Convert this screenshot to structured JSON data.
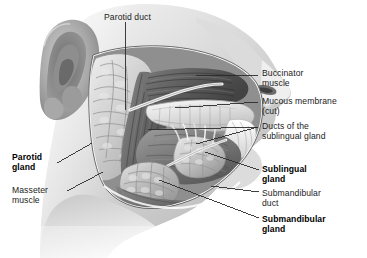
{
  "figure": {
    "background_color": "#ffffff",
    "ink_color": "#1c1c1c",
    "leader_color": "#2b2b2b"
  },
  "labels": [
    {
      "id": "parotid-duct",
      "name": "parotid-duct",
      "lines": [
        "Parotid duct"
      ],
      "bold": false,
      "x": 104,
      "y": 12,
      "align": "left"
    },
    {
      "id": "buccinator-muscle",
      "name": "buccinator-muscle",
      "lines": [
        "Buccinator",
        "muscle"
      ],
      "bold": false,
      "x": 262,
      "y": 68,
      "align": "left"
    },
    {
      "id": "mucous-membrane-cut",
      "name": "mucous-membrane-cut",
      "lines": [
        "Mucous membrane",
        "(cut)"
      ],
      "bold": false,
      "x": 262,
      "y": 96,
      "align": "left"
    },
    {
      "id": "ducts-of-sublingual-gland",
      "name": "ducts-of-the-sublingual-gland",
      "lines": [
        "Ducts of the",
        "sublingual gland"
      ],
      "bold": false,
      "x": 262,
      "y": 121,
      "align": "left"
    },
    {
      "id": "sublingual-gland",
      "name": "sublingual-gland",
      "lines": [
        "Sublingual",
        "gland"
      ],
      "bold": true,
      "x": 262,
      "y": 164,
      "align": "left"
    },
    {
      "id": "submandibular-duct",
      "name": "submandibular-duct",
      "lines": [
        "Submandibular",
        "duct"
      ],
      "bold": false,
      "x": 262,
      "y": 188,
      "align": "left"
    },
    {
      "id": "submandibular-gland",
      "name": "submandibular-gland",
      "lines": [
        "Submandibular",
        "gland"
      ],
      "bold": true,
      "x": 262,
      "y": 214,
      "align": "left"
    },
    {
      "id": "parotid-gland",
      "name": "parotid-gland",
      "lines": [
        "Parotid",
        "gland"
      ],
      "bold": true,
      "x": 12,
      "y": 152,
      "align": "left"
    },
    {
      "id": "masseter-muscle",
      "name": "masseter-muscle",
      "lines": [
        "Masseter",
        "muscle"
      ],
      "bold": false,
      "x": 12,
      "y": 185,
      "align": "left"
    }
  ],
  "leaders": [
    {
      "name": "leader-parotid-duct",
      "points": "125,22 125,110"
    },
    {
      "name": "leader-buccinator-muscle",
      "points": "196,75 258,75"
    },
    {
      "name": "leader-mucous-membrane",
      "points": "175,108 258,102"
    },
    {
      "name": "leader-ducts-sublingual-a",
      "points": "148,130 258,127"
    },
    {
      "name": "leader-ducts-sublingual-b",
      "points": "196,144 258,127"
    },
    {
      "name": "leader-sublingual-gland",
      "points": "205,152 259,170"
    },
    {
      "name": "leader-submandibular-duct",
      "points": "211,186 259,192"
    },
    {
      "name": "leader-submandibular-gland",
      "points": "159,180 259,218"
    },
    {
      "name": "leader-parotid-gland",
      "points": "57,163 92,143"
    },
    {
      "name": "leader-masseter-muscle",
      "points": "67,191 103,172"
    }
  ]
}
